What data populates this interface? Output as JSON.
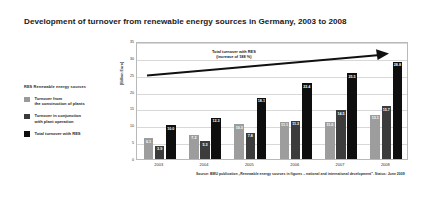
{
  "title": "Development of turnover from renewable energy sources in Germany, 2003 to 2008",
  "legend": {
    "header": "RES  Renewable energy sources",
    "items": [
      {
        "label_line1": "Turnover from",
        "label_line2": "the construction of plants",
        "color": "#9d9d9d",
        "swatch": "light-gray-swatch"
      },
      {
        "label_line1": "Turnover in conjunction",
        "label_line2": "with plant operation",
        "color": "#3c3c3c",
        "swatch": "mid-gray-swatch"
      },
      {
        "label_line1": "Total turnover with RES",
        "label_line2": "",
        "color": "#0e0e0e",
        "swatch": "black-swatch"
      }
    ]
  },
  "annotation": {
    "line1": "Total turnover with RES",
    "line2": "(increase of 188 %)"
  },
  "source": "Source: BMU publication „Renewable energy sources in figures – national and international development\". Status: June 2009",
  "chart_data": {
    "type": "bar",
    "title": "Development of turnover from renewable energy sources in Germany, 2003 to 2008",
    "xlabel": "",
    "ylabel": "[Billion Euro]",
    "categories": [
      "2003",
      "2004",
      "2005",
      "2006",
      "2007",
      "2008"
    ],
    "ylim": [
      0,
      35
    ],
    "yticks": [
      0,
      5,
      10,
      15,
      20,
      25,
      30,
      35
    ],
    "grid": true,
    "legend_position": "left-outside",
    "series": [
      {
        "name": "Turnover from the construction of plants",
        "color": "#9d9d9d",
        "values": [
          6.1,
          7.2,
          10.3,
          11.1,
          11.0,
          13.1
        ]
      },
      {
        "name": "Turnover in conjunction with plant operation",
        "color": "#3c3c3c",
        "values": [
          3.9,
          5.3,
          7.8,
          11.3,
          14.5,
          15.7
        ]
      },
      {
        "name": "Total turnover with RES",
        "color": "#0e0e0e",
        "values": [
          10.0,
          12.3,
          18.1,
          22.4,
          25.5,
          28.8
        ]
      }
    ],
    "annotations": [
      {
        "text": "Total turnover with RES (increase of 188 %)",
        "type": "trend-arrow"
      }
    ]
  }
}
